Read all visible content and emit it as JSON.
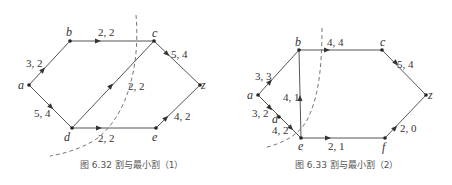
{
  "figures": [
    {
      "caption": "图 6.32   割与最小割（1）",
      "nodes": {
        "a": "a",
        "b": "b",
        "c": "c",
        "z": "z",
        "d": "d",
        "e": "e"
      },
      "edges": [
        {
          "from": "a",
          "to": "b",
          "label": "3, 2"
        },
        {
          "from": "b",
          "to": "c",
          "label": "2, 2"
        },
        {
          "from": "c",
          "to": "z",
          "label": "5, 4"
        },
        {
          "from": "a",
          "to": "d",
          "label": "5, 4"
        },
        {
          "from": "d",
          "to": "c",
          "label": "2, 2"
        },
        {
          "from": "d",
          "to": "e",
          "label": "2, 2"
        },
        {
          "from": "e",
          "to": "z",
          "label": "4, 2"
        }
      ]
    },
    {
      "caption": "图 6.33   割与最小割（2）",
      "nodes": {
        "a": "a",
        "b": "b",
        "c": "c",
        "z": "z",
        "d": "d",
        "e": "e",
        "f": "f"
      },
      "edges": [
        {
          "from": "a",
          "to": "b",
          "label": "3, 3"
        },
        {
          "from": "b",
          "to": "c",
          "label": "4, 4"
        },
        {
          "from": "c",
          "to": "z",
          "label": "5, 4"
        },
        {
          "from": "e",
          "to": "b",
          "label": "4, 1"
        },
        {
          "from": "a",
          "to": "d",
          "label": "3, 2"
        },
        {
          "from": "d",
          "to": "e",
          "label": "4, 2"
        },
        {
          "from": "e",
          "to": "f",
          "label": "2, 1"
        },
        {
          "from": "f",
          "to": "z",
          "label": "2, 0"
        }
      ]
    }
  ]
}
